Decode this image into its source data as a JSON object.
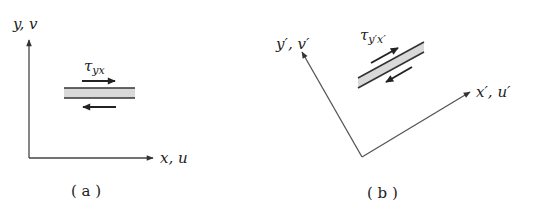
{
  "panels": [
    {
      "id": "a",
      "caption": "( a )",
      "x_axis_label": "x, u",
      "y_axis_label": "y, v",
      "stress_label": "τ",
      "stress_subscript": "yx",
      "element_fill": "#d9d9d9"
    },
    {
      "id": "b",
      "caption": "( b )",
      "x_axis_label": "x′, u′",
      "y_axis_label": "y′, v′",
      "stress_label": "τ",
      "stress_subscript": "y′x′",
      "element_fill": "#d9d9d9"
    }
  ],
  "colors": {
    "line": "#333333",
    "text": "#222222"
  }
}
